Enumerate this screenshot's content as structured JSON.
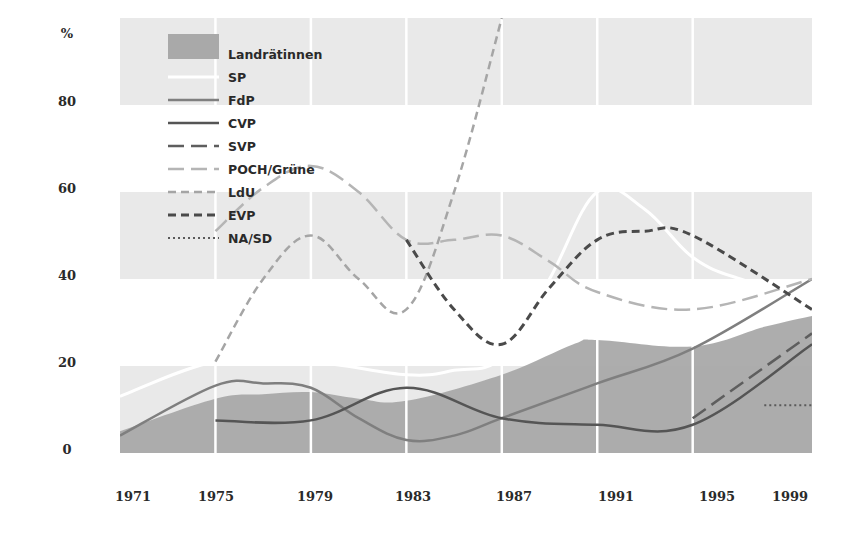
{
  "chart_data": {
    "type": "line",
    "title": "",
    "xlabel": "",
    "ylabel": "%",
    "ylim": [
      0,
      100
    ],
    "yticks": [
      0,
      20,
      40,
      60,
      80
    ],
    "ytick_labels": [
      "0",
      "20",
      "40",
      "60",
      "80"
    ],
    "xlim": [
      1971,
      2000
    ],
    "xticks": [
      1971,
      1975,
      1979,
      1983,
      1987,
      1991,
      1995,
      1999
    ],
    "xtick_labels": [
      "1971",
      "1975",
      "1979",
      "1983",
      "1987",
      "1991",
      "1995",
      "1999"
    ],
    "grid": "alternating horizontal bands (0-20, 40-60, 80-100) with white vertical lines at election years",
    "legend_position": "upper left, inside plot",
    "series": [
      {
        "name": "Landrätinnen",
        "kind": "area",
        "color": "#a9a9a9",
        "x": [
          1971,
          1975,
          1977,
          1979,
          1981,
          1983,
          1987,
          1990,
          1991,
          1995,
          1998,
          2000
        ],
        "y": [
          5,
          12.5,
          13.5,
          14,
          12.5,
          12,
          18,
          25,
          26,
          24.5,
          29,
          31.5
        ]
      },
      {
        "name": "SP",
        "kind": "line",
        "style": "solid",
        "color": "#ffffff",
        "width": 3,
        "x": [
          1971,
          1975,
          1979,
          1983,
          1985,
          1987,
          1989,
          1991,
          1993,
          1995,
          1997,
          2000
        ],
        "y": [
          13,
          21,
          21,
          18,
          19,
          22,
          40,
          60,
          56,
          45,
          40,
          36
        ]
      },
      {
        "name": "FdP",
        "kind": "line",
        "style": "solid",
        "color": "#7f7f7f",
        "width": 2.5,
        "x": [
          1971,
          1975,
          1977,
          1979,
          1981,
          1983,
          1985,
          1987,
          1991,
          1995,
          2000
        ],
        "y": [
          4,
          15.5,
          16,
          15,
          8,
          3,
          4,
          8,
          16,
          24,
          40
        ]
      },
      {
        "name": "CVP",
        "kind": "line",
        "style": "solid",
        "color": "#555555",
        "width": 2.5,
        "x": [
          1975,
          1979,
          1983,
          1987,
          1991,
          1995,
          2000
        ],
        "y": [
          7.5,
          7.5,
          15,
          8,
          6.5,
          6.5,
          25
        ]
      },
      {
        "name": "SVP",
        "kind": "line",
        "style": "long-dash",
        "color": "#5e5e5e",
        "width": 2.5,
        "x": [
          1995,
          2000
        ],
        "y": [
          8,
          27.5
        ]
      },
      {
        "name": "POCH/Grüne",
        "kind": "line",
        "style": "long-dash",
        "color": "#b5b5b5",
        "width": 2.5,
        "x": [
          1975,
          1977,
          1979,
          1981,
          1983,
          1985,
          1987,
          1989,
          1991,
          1995,
          2000
        ],
        "y": [
          51,
          61,
          66,
          60,
          49,
          49,
          50,
          44,
          37,
          33,
          40
        ]
      },
      {
        "name": "LdU",
        "kind": "line",
        "style": "short-dash",
        "color": "#a5a5a5",
        "width": 2.5,
        "x": [
          1975,
          1977,
          1979,
          1981,
          1983,
          1985,
          1987
        ],
        "y": [
          21,
          40,
          50,
          40,
          33,
          60,
          100
        ]
      },
      {
        "name": "EVP",
        "kind": "line",
        "style": "short-dash",
        "color": "#4a4a4a",
        "width": 3,
        "x": [
          1983,
          1985,
          1987,
          1989,
          1991,
          1993,
          1995,
          2000
        ],
        "y": [
          49,
          33,
          25,
          38,
          49,
          51,
          50,
          33
        ]
      },
      {
        "name": "NA/SD",
        "kind": "line",
        "style": "dotted",
        "color": "#5a5a5a",
        "width": 2,
        "x": [
          1998,
          2000
        ],
        "y": [
          11,
          11
        ]
      }
    ]
  },
  "axis": {
    "y_unit_label": "%"
  }
}
